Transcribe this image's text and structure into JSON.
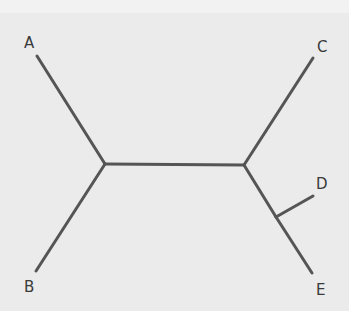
{
  "diagram": {
    "type": "unrooted phylogenetic tree",
    "colors": {
      "background": "#ebebeb",
      "top_band": "#f2f2f2",
      "branch": "#555555",
      "label": "#3a3a3a"
    },
    "nodes": {
      "A": {
        "label": "A"
      },
      "B": {
        "label": "B"
      },
      "C": {
        "label": "C"
      },
      "D": {
        "label": "D"
      },
      "E": {
        "label": "E"
      }
    },
    "edges": [
      [
        "A",
        "n1"
      ],
      [
        "B",
        "n1"
      ],
      [
        "n1",
        "n2"
      ],
      [
        "C",
        "n2"
      ],
      [
        "n2",
        "n3"
      ],
      [
        "D",
        "n3"
      ],
      [
        "E",
        "n3"
      ]
    ]
  }
}
